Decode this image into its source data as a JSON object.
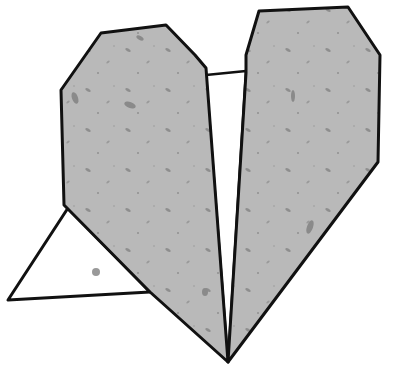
{
  "image": {
    "subject": "origami paper heart illustration",
    "background_color": "#ffffff",
    "paper_color": "#b8b8b8",
    "speckle_color": "#8c8c8c",
    "back_paper_color": "#ffffff",
    "outline_color": "#111111"
  },
  "parts": {
    "left_lobe": "left-heart-lobe",
    "right_lobe": "right-heart-lobe",
    "left_flap": "white-triangle-flap",
    "center_gap": "white-center-gap"
  }
}
